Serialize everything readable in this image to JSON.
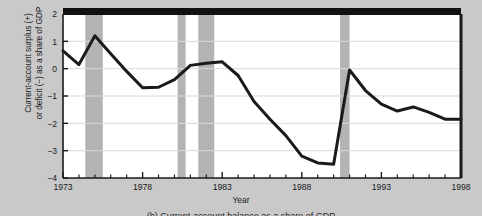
{
  "chart_data": {
    "type": "line",
    "title": "",
    "xlabel": "Year",
    "ylabel": "Current-account surplus (+)\nor deficit (−) as a share of GDP",
    "xlim": [
      1973,
      1998
    ],
    "ylim": [
      -4,
      2
    ],
    "yticks": [
      2,
      1,
      0,
      -1,
      -2,
      -3,
      -4
    ],
    "ytick_labels": [
      "2",
      "1",
      "0",
      "−1",
      "−2",
      "−3",
      "−4"
    ],
    "xticks": [
      1973,
      1978,
      1983,
      1988,
      1993,
      1998
    ],
    "xtick_labels": [
      "1973",
      "1978",
      "1983",
      "1988",
      "1993",
      "1998"
    ],
    "x_minor_tick_interval": 1,
    "grid": "horizontal",
    "legend": "none",
    "x": [
      1973,
      1974,
      1975,
      1976,
      1977,
      1978,
      1979,
      1980,
      1981,
      1982,
      1983,
      1984,
      1985,
      1986,
      1987,
      1988,
      1989,
      1990,
      1991,
      1992,
      1993,
      1994,
      1995,
      1996,
      1997,
      1998
    ],
    "values": [
      0.65,
      0.15,
      1.2,
      0.55,
      -0.1,
      -0.7,
      -0.68,
      -0.4,
      0.12,
      0.2,
      0.25,
      -0.25,
      -1.2,
      -1.85,
      -2.45,
      -3.2,
      -3.45,
      -3.5,
      -0.05,
      -0.8,
      -1.3,
      -1.55,
      -1.4,
      -1.6,
      -1.85,
      -1.85
    ],
    "series": [
      {
        "name": "Current-account balance as share of GDP",
        "color": "#1a1a1a",
        "values": [
          0.65,
          0.15,
          1.2,
          0.55,
          -0.1,
          -0.7,
          -0.68,
          -0.4,
          0.12,
          0.2,
          0.25,
          -0.25,
          -1.2,
          -1.85,
          -2.45,
          -3.2,
          -3.45,
          -3.5,
          -0.05,
          -0.8,
          -1.3,
          -1.55,
          -1.4,
          -1.6,
          -1.85,
          -1.85
        ]
      }
    ],
    "shaded_bands": [
      {
        "name": "recession-band-1",
        "start": 1974.4,
        "end": 1975.5,
        "color": "#b3b3b3"
      },
      {
        "name": "recession-band-2",
        "start": 1980.2,
        "end": 1980.7,
        "color": "#b3b3b3"
      },
      {
        "name": "recession-band-3",
        "start": 1981.5,
        "end": 1982.5,
        "color": "#b3b3b3"
      },
      {
        "name": "recession-band-4",
        "start": 1990.4,
        "end": 1991.0,
        "color": "#b3b3b3"
      }
    ],
    "plot_bg": "#ffffff",
    "figure_bg": "#c9c9c9",
    "grid_color": "#d9d9d9",
    "axis_color": "#1a1a1a",
    "top_border": "thick-black"
  },
  "figure": {
    "caption": "(b) Current-account balance as a share of GDP"
  }
}
